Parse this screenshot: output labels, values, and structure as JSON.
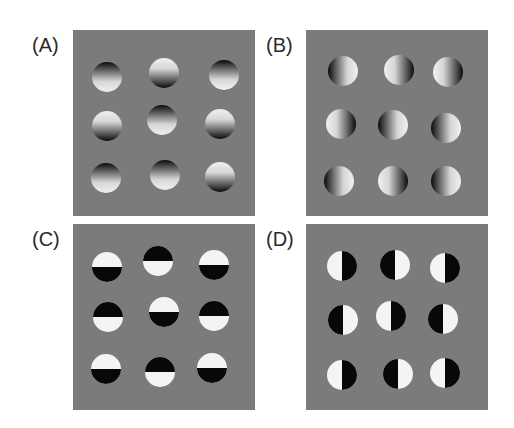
{
  "figure": {
    "background": "#7b7b7b",
    "panels": [
      {
        "id": "A",
        "label": "(A)",
        "type": "shaded-vertical",
        "left": 73,
        "top": 30,
        "circles": [
          {
            "cx": 34,
            "cy": 47,
            "dark": "top"
          },
          {
            "cx": 91,
            "cy": 43,
            "dark": "bottom"
          },
          {
            "cx": 151,
            "cy": 45,
            "dark": "top"
          },
          {
            "cx": 34,
            "cy": 96,
            "dark": "bottom"
          },
          {
            "cx": 89,
            "cy": 90,
            "dark": "top"
          },
          {
            "cx": 147,
            "cy": 94,
            "dark": "bottom"
          },
          {
            "cx": 33,
            "cy": 148,
            "dark": "top"
          },
          {
            "cx": 92,
            "cy": 145,
            "dark": "top"
          },
          {
            "cx": 147,
            "cy": 147,
            "dark": "bottom"
          }
        ]
      },
      {
        "id": "B",
        "label": "(B)",
        "type": "shaded-horizontal",
        "left": 306,
        "top": 30,
        "circles": [
          {
            "cx": 37,
            "cy": 41,
            "dark": "left"
          },
          {
            "cx": 93,
            "cy": 40,
            "dark": "right"
          },
          {
            "cx": 142,
            "cy": 42,
            "dark": "right"
          },
          {
            "cx": 35,
            "cy": 94,
            "dark": "right"
          },
          {
            "cx": 87,
            "cy": 95,
            "dark": "left"
          },
          {
            "cx": 140,
            "cy": 98,
            "dark": "left"
          },
          {
            "cx": 33,
            "cy": 151,
            "dark": "left"
          },
          {
            "cx": 87,
            "cy": 151,
            "dark": "right"
          },
          {
            "cx": 140,
            "cy": 151,
            "dark": "left"
          }
        ]
      },
      {
        "id": "C",
        "label": "(C)",
        "type": "split-horizontal",
        "left": 73,
        "top": 224,
        "circles": [
          {
            "cx": 34,
            "cy": 43,
            "dark": "bottom"
          },
          {
            "cx": 85,
            "cy": 37,
            "dark": "top"
          },
          {
            "cx": 141,
            "cy": 41,
            "dark": "bottom"
          },
          {
            "cx": 35,
            "cy": 93,
            "dark": "top"
          },
          {
            "cx": 91,
            "cy": 88,
            "dark": "bottom"
          },
          {
            "cx": 141,
            "cy": 92,
            "dark": "top"
          },
          {
            "cx": 33,
            "cy": 145,
            "dark": "bottom"
          },
          {
            "cx": 87,
            "cy": 148,
            "dark": "top"
          },
          {
            "cx": 139,
            "cy": 144,
            "dark": "bottom"
          }
        ]
      },
      {
        "id": "D",
        "label": "(D)",
        "type": "split-vertical",
        "left": 306,
        "top": 224,
        "circles": [
          {
            "cx": 36,
            "cy": 42,
            "dark": "right"
          },
          {
            "cx": 89,
            "cy": 41,
            "dark": "left"
          },
          {
            "cx": 139,
            "cy": 44,
            "dark": "right"
          },
          {
            "cx": 37,
            "cy": 96,
            "dark": "left"
          },
          {
            "cx": 85,
            "cy": 92,
            "dark": "right"
          },
          {
            "cx": 137,
            "cy": 95,
            "dark": "left"
          },
          {
            "cx": 36,
            "cy": 151,
            "dark": "right"
          },
          {
            "cx": 92,
            "cy": 150,
            "dark": "left"
          },
          {
            "cx": 139,
            "cy": 149,
            "dark": "right"
          }
        ]
      }
    ],
    "circle_radius": 15
  }
}
